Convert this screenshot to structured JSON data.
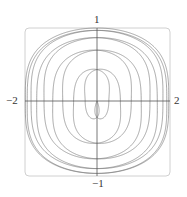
{
  "chart_data": {
    "type": "line",
    "title": "",
    "xlabel": "",
    "ylabel": "",
    "xlim": [
      -2,
      2
    ],
    "ylim": [
      -1,
      1
    ],
    "grid": false,
    "legend": null,
    "tick_labels": {
      "x_min": "−2",
      "x_max": "2",
      "y_max": "1",
      "y_min": "−1"
    },
    "curve": {
      "description": "Parametric curve (dense Lissajous-like loops) filling the box, widest at y=0 reaching x=±2, flattened near y=±1, pinched near x=0",
      "x_expr": "sin(t) + sin(9t/10)",
      "y_expr": "cos(t)·cos(9t/10) style envelope, normalized to [-1,1]",
      "t_range": [
        0,
        62.83
      ],
      "color": "#6e6e6e"
    },
    "frame_color": "#d0d0d0",
    "axis_color": "#555555"
  }
}
